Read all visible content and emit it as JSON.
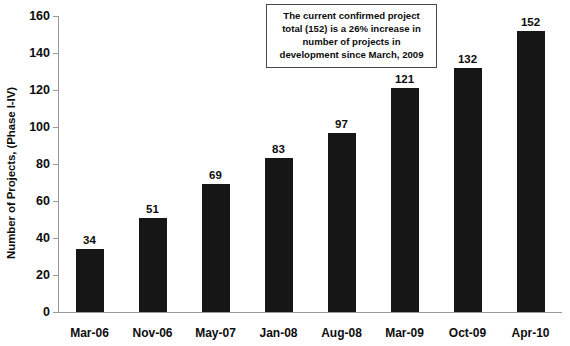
{
  "chart_data": {
    "type": "bar",
    "title": "",
    "xlabel": "",
    "ylabel": "Number of Projects, (Phase I-IV)",
    "categories": [
      "Mar-06",
      "Nov-06",
      "May-07",
      "Jan-08",
      "Aug-08",
      "Mar-09",
      "Oct-09",
      "Apr-10"
    ],
    "values": [
      34,
      51,
      69,
      83,
      97,
      121,
      132,
      152
    ],
    "ylim": [
      0,
      160
    ],
    "yticks": [
      0,
      20,
      40,
      60,
      80,
      100,
      120,
      140,
      160
    ],
    "ytick_labels": [
      "0",
      "20",
      "40",
      "60",
      "80",
      "100",
      "120",
      "140",
      "160"
    ],
    "grid": false,
    "legend": false,
    "bar_color": "#161616",
    "axis_color": "#9a9a9a",
    "text_color": "#0d0d0d",
    "data_labels": [
      "34",
      "51",
      "69",
      "83",
      "97",
      "121",
      "132",
      "152"
    ],
    "annotations": [
      {
        "name": "callout-box",
        "lines": [
          "The current confirmed project",
          "total (152) is a 26% increase in",
          "number of projects in",
          "development since March, 2009"
        ],
        "border_color": "#4a4a4a",
        "background": "#ffffff"
      }
    ]
  }
}
